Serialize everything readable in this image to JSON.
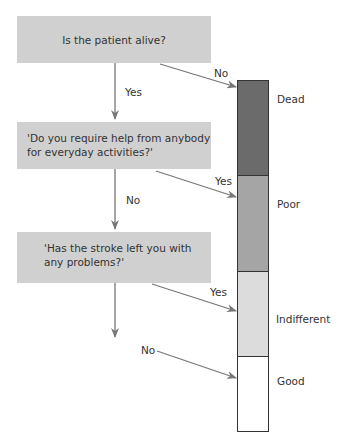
{
  "questions": [
    {
      "text": "Is the patient alive?"
    },
    {
      "text": "'Do you require help from anybody for everyday activities?'",
      "line1": "'Do you require help from anybody",
      "line2": "for everyday activities?'"
    },
    {
      "text": "'Has the stroke left you with any problems?'",
      "line1": "'Has the stroke left you with",
      "line2": "any problems?'"
    }
  ],
  "branch_labels": {
    "q1_yes": "Yes",
    "q1_no": "No",
    "q2_yes": "Yes",
    "q2_no": "No",
    "q3_yes": "Yes",
    "q3_no": "No"
  },
  "outcomes": [
    {
      "label": "Dead",
      "color": "#6b6b6b"
    },
    {
      "label": "Poor",
      "color": "#a5a5a5"
    },
    {
      "label": "Indifferent",
      "color": "#dcdcdc"
    },
    {
      "label": "Good",
      "color": "#ffffff"
    }
  ],
  "colors": {
    "question_box": "#d0d0d0",
    "arrow": "#777777",
    "border": "#333333"
  }
}
